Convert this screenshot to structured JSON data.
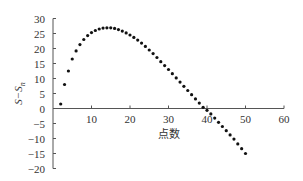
{
  "chart_data": {
    "type": "scatter",
    "title": "",
    "xlabel": "点数",
    "ylabel": "S−Sn",
    "xlim": [
      0,
      60
    ],
    "ylim": [
      -20,
      30
    ],
    "xticks": [
      10,
      20,
      30,
      40,
      50,
      60
    ],
    "yticks": [
      30,
      25,
      20,
      15,
      10,
      5,
      0,
      -5,
      -10,
      -15,
      -20
    ],
    "grid": false,
    "legend": null,
    "series": [
      {
        "name": "S-Sn",
        "x": [
          2,
          3,
          4,
          5,
          6,
          7,
          8,
          9,
          10,
          11,
          12,
          13,
          14,
          15,
          16,
          17,
          18,
          19,
          20,
          21,
          22,
          23,
          24,
          25,
          26,
          27,
          28,
          29,
          30,
          31,
          32,
          33,
          34,
          35,
          36,
          37,
          38,
          39,
          40,
          41,
          42,
          43,
          44,
          45,
          46,
          47,
          48,
          49,
          50
        ],
        "y": [
          1.5,
          8,
          12.5,
          16.5,
          19.2,
          21.3,
          23,
          24.3,
          25.3,
          26,
          26.5,
          26.8,
          26.9,
          26.9,
          26.7,
          26.3,
          25.8,
          25.2,
          24.5,
          23.7,
          22.8,
          21.8,
          20.7,
          19.5,
          18.3,
          17,
          15.6,
          14.3,
          13,
          11.6,
          10.2,
          8.8,
          7.4,
          6,
          4.6,
          3.2,
          1.8,
          0.4,
          -0.6,
          -1.8,
          -3.2,
          -4.6,
          -6,
          -7.4,
          -8.8,
          -10.2,
          -11.8,
          -13.4,
          -15
        ]
      }
    ]
  }
}
